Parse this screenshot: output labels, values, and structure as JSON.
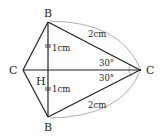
{
  "diagram": {
    "points": {
      "B_top": {
        "label": "B",
        "x": 48,
        "y": 22
      },
      "B_bottom": {
        "label": "B",
        "x": 48,
        "y": 117
      },
      "C_left": {
        "label": "C",
        "x": 23,
        "y": 70
      },
      "C_right": {
        "label": "C",
        "x": 140,
        "y": 70
      },
      "H": {
        "label": "H",
        "x": 48,
        "y": 70
      }
    },
    "labels": {
      "top_half": "1cm",
      "bottom_half": "1cm",
      "upper_side": "2cm",
      "lower_side": "2cm",
      "upper_angle": "30°",
      "lower_angle": "30°"
    },
    "colors": {
      "line": "#222222",
      "arc": "#9a9a9a"
    }
  }
}
